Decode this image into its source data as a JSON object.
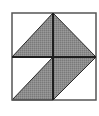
{
  "diagram": {
    "colors": {
      "background": "#ffffff",
      "outline": "#2a2a2a",
      "shade": "#8c8c8c",
      "frame": "#555555"
    },
    "outer_square": {
      "x": 12,
      "y": 13,
      "width": 84,
      "height": 87
    },
    "midlines": {
      "vertical_x": 53,
      "horizontal_y": 57
    },
    "shapes": [
      {
        "name": "top-triangle",
        "type": "triangle",
        "points": "53,13 12,57 96,57"
      },
      {
        "name": "bottom-parallelogram",
        "type": "parallelogram",
        "points": "12,100 53,57 96,57 53,100"
      }
    ]
  }
}
